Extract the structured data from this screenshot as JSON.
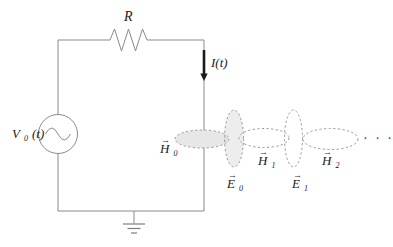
{
  "diagram": {
    "resistor_label": "R",
    "current_label": "I(t)",
    "source_label": {
      "letter": "V",
      "sub": "0",
      "rest": "(t)"
    },
    "field_labels": {
      "H0": {
        "arrow": "→",
        "letter": "H",
        "sub": "0"
      },
      "E0": {
        "arrow": "→",
        "letter": "E",
        "sub": "0"
      },
      "H1": {
        "arrow": "→",
        "letter": "H",
        "sub": "1"
      },
      "E1": {
        "arrow": "→",
        "letter": "E",
        "sub": "1"
      },
      "H2": {
        "arrow": "→",
        "letter": "H",
        "sub": "2"
      }
    },
    "continuation_dots": "· · ·",
    "colors": {
      "wire": "#8a8a8a",
      "loop_stroke": "#9a9a9a",
      "h0_loop_fill": "#e7e7e7",
      "e0_loop_fill": "rgba(210,210,210,0.40)",
      "text": "#222222",
      "current_arrow": "#1a1a1a"
    }
  }
}
